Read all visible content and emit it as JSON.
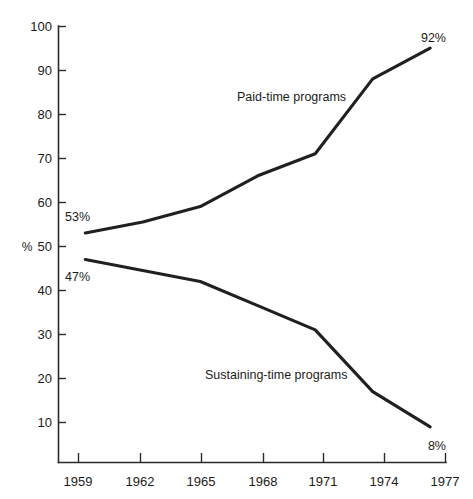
{
  "chart_data": {
    "type": "line",
    "title": "",
    "subtitle": "",
    "xlabel": "",
    "ylabel": "%",
    "x": [
      1959,
      1962,
      1965,
      1968,
      1971,
      1974,
      1977
    ],
    "xtick_labels": [
      "1959",
      "1962",
      "1965",
      "1968",
      "1971",
      "1974",
      "1977"
    ],
    "ytick_labels": [
      "10",
      "20",
      "30",
      "40",
      "50",
      "60",
      "70",
      "80",
      "90",
      "100"
    ],
    "ytick_values": [
      10,
      20,
      30,
      40,
      50,
      60,
      70,
      80,
      90,
      100
    ],
    "xlim": [
      1957.6,
      1977.8
    ],
    "ylim": [
      0.9,
      100
    ],
    "grid": false,
    "legend": "inline-labels",
    "series": [
      {
        "name": "Paid-time programs",
        "label": "Paid-time programs",
        "color": "#231f20",
        "values": [
          53,
          55.5,
          59,
          66,
          71,
          88,
          95
        ],
        "start_label": "53%",
        "end_label": "92%"
      },
      {
        "name": "Sustaining-time programs",
        "label": "Sustaining-time programs",
        "color": "#231f20",
        "values": [
          47,
          44.5,
          42,
          36.5,
          31,
          17,
          9
        ],
        "start_label": "47%",
        "end_label": "8%"
      }
    ],
    "annotations": [
      {
        "text": "53%",
        "series": "Paid-time programs",
        "position": "start-above"
      },
      {
        "text": "92%",
        "series": "Paid-time programs",
        "position": "end-above"
      },
      {
        "text": "47%",
        "series": "Sustaining-time programs",
        "position": "start-below"
      },
      {
        "text": "8%",
        "series": "Sustaining-time programs",
        "position": "end-below"
      }
    ]
  },
  "axis": {
    "y_unit": "%",
    "y_ticks": [
      {
        "label": "100",
        "value": 100
      },
      {
        "label": "90",
        "value": 90
      },
      {
        "label": "80",
        "value": 80
      },
      {
        "label": "70",
        "value": 70
      },
      {
        "label": "60",
        "value": 60
      },
      {
        "label": "50",
        "value": 50
      },
      {
        "label": "40",
        "value": 40
      },
      {
        "label": "30",
        "value": 30
      },
      {
        "label": "20",
        "value": 20
      },
      {
        "label": "10",
        "value": 10
      }
    ],
    "x_ticks": [
      {
        "label": "1959",
        "value": 1959
      },
      {
        "label": "1962",
        "value": 1962
      },
      {
        "label": "1965",
        "value": 1965
      },
      {
        "label": "1968",
        "value": 1968
      },
      {
        "label": "1971",
        "value": 1971
      },
      {
        "label": "1974",
        "value": 1974
      },
      {
        "label": "1977",
        "value": 1977
      }
    ]
  },
  "labels": {
    "paid_time": "Paid-time programs",
    "sustaining_time": "Sustaining-time programs",
    "paid_start": "53%",
    "paid_end": "92%",
    "sustaining_start": "47%",
    "sustaining_end": "8%"
  }
}
